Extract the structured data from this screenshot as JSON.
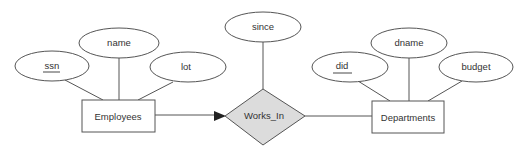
{
  "diagram": {
    "type": "er-diagram",
    "entities": [
      {
        "id": "employees",
        "label": "Employees",
        "attributes": [
          "ssn",
          "name",
          "lot"
        ],
        "key": "ssn"
      },
      {
        "id": "departments",
        "label": "Departments",
        "attributes": [
          "did",
          "dname",
          "budget"
        ],
        "key": "did"
      }
    ],
    "relationships": [
      {
        "id": "works_in",
        "label": "Works_In",
        "attributes": [
          "since"
        ],
        "participants": [
          {
            "entity": "employees",
            "constraint": "key (arrow)"
          },
          {
            "entity": "departments",
            "constraint": "many"
          }
        ]
      }
    ],
    "attribute_labels": {
      "ssn": "ssn",
      "name": "name",
      "lot": "lot",
      "since": "since",
      "did": "did",
      "dname": "dname",
      "budget": "budget"
    },
    "entity_labels": {
      "employees": "Employees",
      "departments": "Departments"
    },
    "relationship_labels": {
      "works_in": "Works_In"
    },
    "colors": {
      "relationship_fill": "#dcdcdc",
      "stroke": "#555555",
      "background": "#ffffff"
    }
  }
}
